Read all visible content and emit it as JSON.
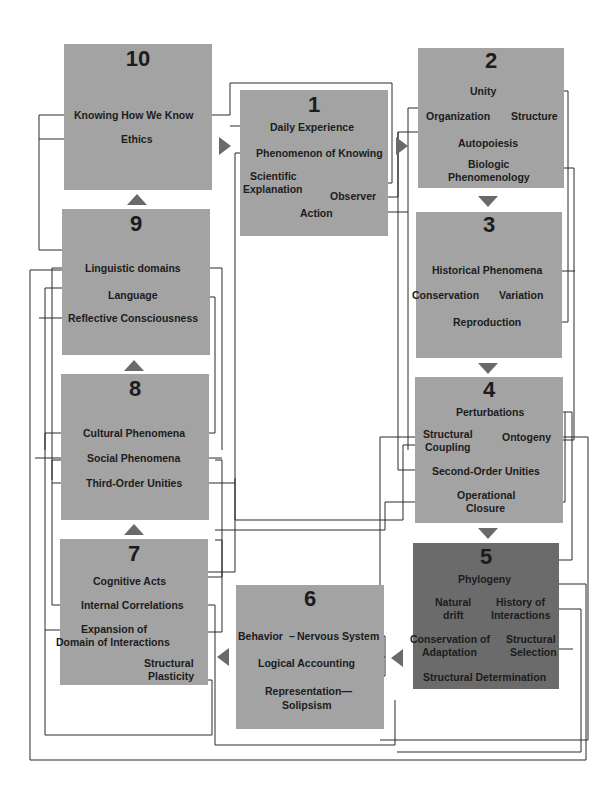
{
  "diagram": {
    "colors": {
      "box": "#a3a3a3",
      "box_highlight": "#6b6b6b",
      "line": "#2a2a2a",
      "arrow": "#6a6a6a"
    },
    "boxes": [
      {
        "id": "1",
        "number": "1",
        "concepts": [
          "Daily Experience",
          "Phenomenon of Knowing",
          "Scientific Explanation",
          "Observer",
          "Action"
        ]
      },
      {
        "id": "2",
        "number": "2",
        "concepts": [
          "Unity",
          "Organization",
          "Structure",
          "Autopoiesis",
          "Biologic Phenomenology"
        ]
      },
      {
        "id": "3",
        "number": "3",
        "concepts": [
          "Historical Phenomena",
          "Conservation",
          "Variation",
          "Reproduction"
        ]
      },
      {
        "id": "4",
        "number": "4",
        "concepts": [
          "Perturbations",
          "Structural Coupling",
          "Ontogeny",
          "Second-Order Unities",
          "Operational Closure"
        ]
      },
      {
        "id": "5",
        "number": "5",
        "highlighted": true,
        "concepts": [
          "Phylogeny",
          "Natural drift",
          "History of Interactions",
          "Conservation of Adaptation",
          "Structural Selection",
          "Structural Determination"
        ]
      },
      {
        "id": "6",
        "number": "6",
        "concepts": [
          "Behavior",
          "Nervous System",
          "Logical Accounting",
          "Representation",
          "Solipsism"
        ]
      },
      {
        "id": "7",
        "number": "7",
        "concepts": [
          "Cognitive Acts",
          "Internal Correlations",
          "Expansion of Domain of Interactions",
          "Structural Plasticity"
        ]
      },
      {
        "id": "8",
        "number": "8",
        "concepts": [
          "Cultural Phenomena",
          "Social Phenomena",
          "Third-Order Unities"
        ]
      },
      {
        "id": "9",
        "number": "9",
        "concepts": [
          "Linguistic domains",
          "Language",
          "Reflective Consciousness"
        ]
      },
      {
        "id": "10",
        "number": "10",
        "concepts": [
          "Knowing How We Know",
          "Ethics"
        ]
      }
    ],
    "labels": {
      "b1_daily": "Daily Experience",
      "b1_phen": "Phenomenon of Knowing",
      "b1_sci": "Scientific",
      "b1_expl": "Explanation",
      "b1_obs": "Observer",
      "b1_action": "Action",
      "b2_unity": "Unity",
      "b2_org": "Organization",
      "b2_struct": "Structure",
      "b2_auto": "Autopoiesis",
      "b2_bio1": "Biologic",
      "b2_bio2": "Phenomenology",
      "b3_hist": "Historical Phenomena",
      "b3_cons": "Conservation",
      "b3_var": "Variation",
      "b3_repro": "Reproduction",
      "b4_pert": "Perturbations",
      "b4_sc1": "Structural",
      "b4_sc2": "Coupling",
      "b4_onto": "Ontogeny",
      "b4_sou": "Second-Order Unities",
      "b4_oc1": "Operational",
      "b4_oc2": "Closure",
      "b5_phylo": "Phylogeny",
      "b5_nd1": "Natural",
      "b5_nd2": "drift",
      "b5_hi1": "History of",
      "b5_hi2": "Interactions",
      "b5_ca1": "Conservation of",
      "b5_ca2": "Adaptation",
      "b5_ss1": "Structural",
      "b5_ss2": "Selection",
      "b5_sd": "Structural Determination",
      "b6_beh": "Behavior",
      "b6_dash": "–",
      "b6_ns": "Nervous System",
      "b6_la": "Logical Accounting",
      "b6_rep": "Representation—",
      "b6_sol": "Solipsism",
      "b7_ca": "Cognitive Acts",
      "b7_ic": "Internal Correlations",
      "b7_exp1": "Expansion of",
      "b7_exp2": "Domain of Interactions",
      "b7_sp1": "Structural",
      "b7_sp2": "Plasticity",
      "b8_cult": "Cultural Phenomena",
      "b8_soc": "Social Phenomena",
      "b8_tou": "Third-Order Unities",
      "b9_ling": "Linguistic domains",
      "b9_lang": "Language",
      "b9_refl": "Reflective Consciousness",
      "b10_khwk": "Knowing How We Know",
      "b10_eth": "Ethics"
    },
    "flow": [
      "1",
      "2",
      "3",
      "4",
      "5",
      "6",
      "7",
      "8",
      "9",
      "10",
      "1"
    ]
  }
}
